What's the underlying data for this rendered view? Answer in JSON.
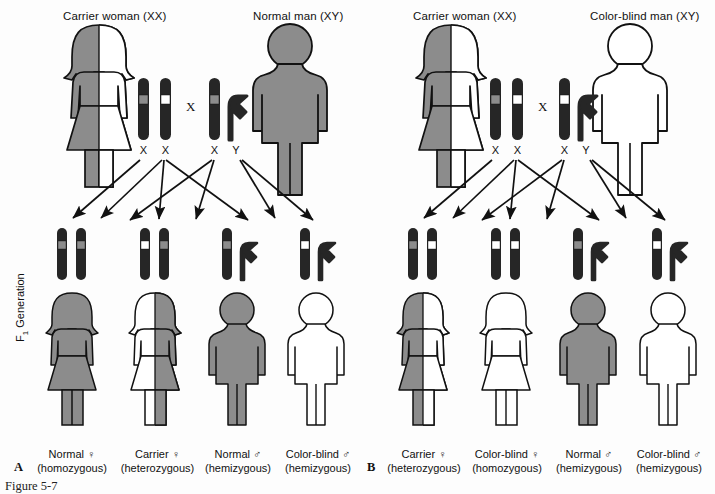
{
  "figure": {
    "caption": "Figure 5-7",
    "f1_generation_label_prefix": "F",
    "f1_generation_label_sub": "1",
    "f1_generation_label_suffix": " Generation",
    "cross_symbol": "X",
    "colors": {
      "affected_gray": "#8c8c8c",
      "normal_white": "#ffffff",
      "chromosome_dark": "#262626",
      "outline": "#111111",
      "background": "#fdfdfd"
    }
  },
  "panels": [
    {
      "letter": "A",
      "parents": {
        "mother": {
          "title": "Carrier woman (XX)",
          "figure_fill_left": "#8c8c8c",
          "figure_fill_right": "#ffffff",
          "chromosomes": [
            {
              "label": "X",
              "band": "#8c8c8c"
            },
            {
              "label": "X",
              "band": "#ffffff"
            }
          ]
        },
        "father": {
          "title": "Normal man (XY)",
          "figure_fill": "#8c8c8c",
          "chromosomes": [
            {
              "label": "X",
              "band": "#8c8c8c"
            },
            {
              "label": "Y",
              "band": null
            }
          ]
        }
      },
      "offspring": [
        {
          "sex": "female",
          "label_line1": "Normal ♀",
          "label_line2": "(homozygous)",
          "figure_fill_left": "#8c8c8c",
          "figure_fill_right": "#8c8c8c",
          "chromosomes": [
            {
              "type": "X",
              "band": "#8c8c8c"
            },
            {
              "type": "X",
              "band": "#8c8c8c"
            }
          ]
        },
        {
          "sex": "female",
          "label_line1": "Carrier ♀",
          "label_line2": "(heterozygous)",
          "figure_fill_left": "#ffffff",
          "figure_fill_right": "#8c8c8c",
          "chromosomes": [
            {
              "type": "X",
              "band": "#ffffff"
            },
            {
              "type": "X",
              "band": "#8c8c8c"
            }
          ]
        },
        {
          "sex": "male",
          "label_line1": "Normal ♂",
          "label_line2": "(hemizygous)",
          "figure_fill": "#8c8c8c",
          "chromosomes": [
            {
              "type": "X",
              "band": "#8c8c8c"
            },
            {
              "type": "Y",
              "band": null
            }
          ]
        },
        {
          "sex": "male",
          "label_line1": "Color-blind ♂",
          "label_line2": "(hemizygous)",
          "figure_fill": "#ffffff",
          "chromosomes": [
            {
              "type": "X",
              "band": "#ffffff"
            },
            {
              "type": "Y",
              "band": null
            }
          ]
        }
      ]
    },
    {
      "letter": "B",
      "parents": {
        "mother": {
          "title": "Carrier woman (XX)",
          "figure_fill_left": "#8c8c8c",
          "figure_fill_right": "#ffffff",
          "chromosomes": [
            {
              "label": "X",
              "band": "#8c8c8c"
            },
            {
              "label": "X",
              "band": "#ffffff"
            }
          ]
        },
        "father": {
          "title": "Color-blind man (XY)",
          "figure_fill": "#ffffff",
          "chromosomes": [
            {
              "label": "X",
              "band": "#ffffff"
            },
            {
              "label": "Y",
              "band": null
            }
          ]
        }
      },
      "offspring": [
        {
          "sex": "female",
          "label_line1": "Carrier ♀",
          "label_line2": "(heterozygous)",
          "figure_fill_left": "#8c8c8c",
          "figure_fill_right": "#ffffff",
          "chromosomes": [
            {
              "type": "X",
              "band": "#8c8c8c"
            },
            {
              "type": "X",
              "band": "#ffffff"
            }
          ]
        },
        {
          "sex": "female",
          "label_line1": "Color-blind ♀",
          "label_line2": "(homozygous)",
          "figure_fill_left": "#ffffff",
          "figure_fill_right": "#ffffff",
          "chromosomes": [
            {
              "type": "X",
              "band": "#ffffff"
            },
            {
              "type": "X",
              "band": "#ffffff"
            }
          ]
        },
        {
          "sex": "male",
          "label_line1": "Normal ♂",
          "label_line2": "(hemizygous)",
          "figure_fill": "#8c8c8c",
          "chromosomes": [
            {
              "type": "X",
              "band": "#8c8c8c"
            },
            {
              "type": "Y",
              "band": null
            }
          ]
        },
        {
          "sex": "male",
          "label_line1": "Color-blind ♂",
          "label_line2": "(hemizygous)",
          "figure_fill": "#ffffff",
          "chromosomes": [
            {
              "type": "X",
              "band": "#ffffff"
            },
            {
              "type": "Y",
              "band": null
            }
          ]
        }
      ]
    }
  ]
}
